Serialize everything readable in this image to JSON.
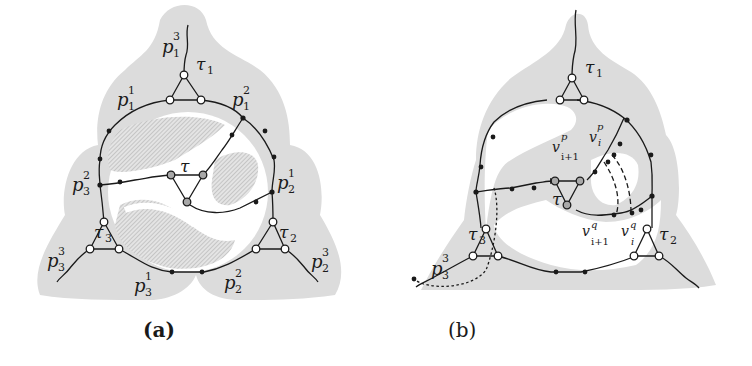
{
  "figure": {
    "panels": [
      {
        "id": "a",
        "caption": "(a)",
        "labels": {
          "tau": "τ",
          "tau1": "τ",
          "tau1_sub": "1",
          "tau2": "τ",
          "tau2_sub": "2",
          "tau3": "τ",
          "tau3_sub": "3",
          "p": "p",
          "p13_sub": "1",
          "p13_sup": "3",
          "p11_sub": "1",
          "p11_sup": "1",
          "p12_sub": "1",
          "p12_sup": "2",
          "p32_sub": "3",
          "p32_sup": "2",
          "p21_sub": "2",
          "p21_sup": "1",
          "p33_sub": "3",
          "p33_sup": "3",
          "p31_sub": "3",
          "p31_sup": "1",
          "p22_sub": "2",
          "p22_sup": "2",
          "p23_sub": "2",
          "p23_sup": "3"
        }
      },
      {
        "id": "b",
        "caption": "(b)",
        "labels": {
          "tau": "τ",
          "tau1": "τ",
          "tau1_sub": "1",
          "tau2": "τ",
          "tau2_sub": "2",
          "tau3": "τ",
          "tau3_sub": "3",
          "p": "p",
          "p33_sub": "3",
          "p33_sup": "3",
          "v": "v",
          "vp_i_sup": "p",
          "vp_i_sub": "i",
          "vp_i1_sup": "p",
          "vp_i1_sub": "i+1",
          "vq_i_sup": "q",
          "vq_i_sub": "i",
          "vq_i1_sup": "q",
          "vq_i1_sub": "i+1"
        }
      }
    ],
    "colors": {
      "shade": "#dcdcdc",
      "hatch": "#bdbdbd",
      "line": "#1a1a1a",
      "tau_node_fill": "#a8a8a8",
      "open_node_fill": "#ffffff"
    }
  }
}
